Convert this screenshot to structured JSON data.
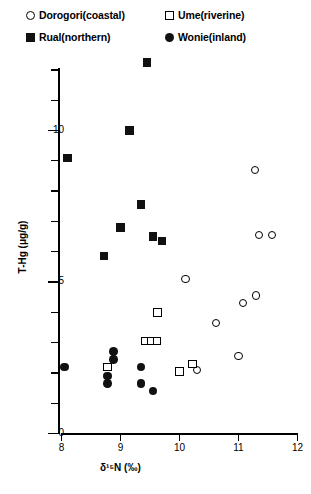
{
  "legend": {
    "items": [
      {
        "label": "Dorogori(coastal)",
        "marker": "open-circle-icon",
        "col": 1,
        "row": 1
      },
      {
        "label": "Rual(northern)",
        "marker": "filled-square-icon",
        "col": 1,
        "row": 2
      },
      {
        "label": "Ume(riverine)",
        "marker": "open-square-icon",
        "col": 2,
        "row": 1
      },
      {
        "label": "Wonie(inland)",
        "marker": "filled-circle-icon",
        "col": 2,
        "row": 2
      }
    ]
  },
  "chart_data": {
    "type": "scatter",
    "title": "",
    "xlabel": "δ¹⁵N (‰)",
    "ylabel": "T-Hg (μg/g)",
    "xlim": [
      8,
      12
    ],
    "ylim": [
      0,
      12.6
    ],
    "xticks": [
      8,
      9,
      10,
      11,
      12
    ],
    "xtick_labels": [
      "8",
      "9",
      "10",
      "11",
      "12"
    ],
    "yticks_major": [
      0,
      5,
      10
    ],
    "ytick_labels": [
      "0",
      "5",
      "10"
    ],
    "yticks_minor": [
      1,
      2,
      3,
      4,
      6,
      7,
      8,
      9,
      11,
      12
    ],
    "grid": false,
    "legend_position": "above-plot",
    "series": [
      {
        "name": "Dorogori(coastal)",
        "marker": "open-circle",
        "points": [
          [
            11.28,
            8.7
          ],
          [
            11.35,
            6.55
          ],
          [
            11.57,
            6.55
          ],
          [
            10.1,
            5.1
          ],
          [
            11.08,
            4.3
          ],
          [
            11.3,
            4.55
          ],
          [
            10.62,
            3.65
          ],
          [
            11.0,
            2.55
          ],
          [
            10.3,
            2.1
          ]
        ]
      },
      {
        "name": "Rual(northern)",
        "marker": "filled-square",
        "points": [
          [
            9.45,
            12.25
          ],
          [
            9.15,
            10.0
          ],
          [
            8.1,
            9.1
          ],
          [
            9.35,
            7.55
          ],
          [
            9.7,
            6.35
          ],
          [
            9.0,
            6.8
          ],
          [
            9.55,
            6.5
          ],
          [
            8.72,
            5.85
          ]
        ]
      },
      {
        "name": "Ume(riverine)",
        "marker": "open-square",
        "points": [
          [
            9.63,
            4.0
          ],
          [
            9.42,
            3.05
          ],
          [
            9.52,
            3.05
          ],
          [
            9.62,
            3.05
          ],
          [
            10.0,
            2.05
          ],
          [
            10.22,
            2.3
          ],
          [
            8.78,
            2.2
          ]
        ]
      },
      {
        "name": "Wonie(inland)",
        "marker": "filled-circle",
        "points": [
          [
            8.05,
            2.2
          ],
          [
            8.88,
            2.7
          ],
          [
            8.88,
            2.45
          ],
          [
            8.78,
            1.9
          ],
          [
            8.78,
            1.65
          ],
          [
            9.35,
            2.2
          ],
          [
            9.35,
            1.65
          ],
          [
            9.55,
            1.4
          ]
        ]
      }
    ]
  }
}
